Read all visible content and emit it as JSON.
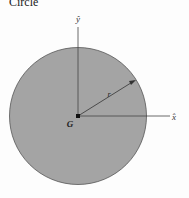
{
  "title": "Circle",
  "labels": {
    "y_axis": "ŷ",
    "x_axis": "x̂",
    "center": "G",
    "radius": "r"
  },
  "colors": {
    "fill": "#a4a4a4",
    "stroke": "#555555",
    "axis": "#444444"
  }
}
